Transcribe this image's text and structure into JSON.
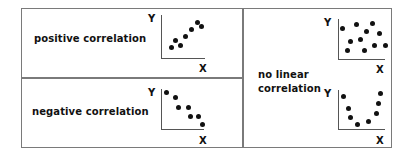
{
  "panels": [
    {
      "id": "positive",
      "label": "positive correlation",
      "x_label": "X",
      "y_label": "Y",
      "points": [
        [
          171,
          47
        ],
        [
          175,
          40
        ],
        [
          180,
          45
        ],
        [
          185,
          36
        ],
        [
          191,
          29
        ],
        [
          197,
          22
        ],
        [
          201,
          26
        ]
      ]
    },
    {
      "id": "negative",
      "label": "negative correlation",
      "x_label": "X",
      "y_label": "Y",
      "points": [
        [
          166,
          92
        ],
        [
          175,
          97
        ],
        [
          178,
          107
        ],
        [
          188,
          107
        ],
        [
          190,
          116
        ],
        [
          198,
          116
        ],
        [
          202,
          124
        ]
      ]
    },
    {
      "id": "none",
      "label_line1": "no linear",
      "label_line2": "correlation",
      "scatter": {
        "x_label": "X",
        "y_label": "Y",
        "points": [
          [
            342,
            28
          ],
          [
            356,
            24
          ],
          [
            372,
            23
          ],
          [
            366,
            31
          ],
          [
            379,
            33
          ],
          [
            350,
            41
          ],
          [
            360,
            39
          ],
          [
            347,
            50
          ],
          [
            364,
            50
          ],
          [
            374,
            45
          ],
          [
            385,
            45
          ]
        ]
      },
      "curve": {
        "x_label": "X",
        "y_label": "Y",
        "points": [
          [
            343,
            96
          ],
          [
            348,
            108
          ],
          [
            350,
            117
          ],
          [
            357,
            124
          ],
          [
            368,
            121
          ],
          [
            376,
            113
          ],
          [
            378,
            103
          ],
          [
            380,
            93
          ]
        ]
      }
    }
  ]
}
